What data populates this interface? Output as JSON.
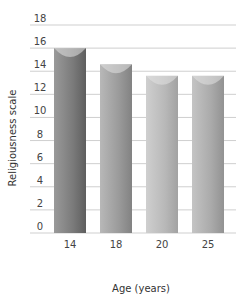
{
  "chart_data": {
    "type": "bar",
    "title": "",
    "xlabel": "Age (years)",
    "ylabel": "Religiousness scale",
    "categories": [
      "14",
      "18",
      "20",
      "25"
    ],
    "values": [
      16,
      14.6,
      13.6,
      13.6
    ],
    "ylim": [
      0,
      18
    ],
    "yticks": [
      0,
      2,
      4,
      6,
      8,
      10,
      12,
      14,
      16,
      18
    ],
    "grid": true,
    "legend": null,
    "bar_colors": [
      "#7a7a7a",
      "#9a9a9a",
      "#b5b5b5",
      "#a8a8a8"
    ]
  }
}
